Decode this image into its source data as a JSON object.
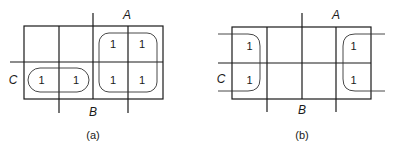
{
  "maps": [
    {
      "caption": "(a)",
      "labels": {
        "A": "A",
        "B": "B",
        "C": "C"
      },
      "cells": [
        [
          "",
          "",
          "1",
          "1"
        ],
        [
          "1",
          "1",
          "1",
          "1"
        ]
      ]
    },
    {
      "caption": "(b)",
      "labels": {
        "A": "A",
        "B": "B",
        "C": "C"
      },
      "cells": [
        [
          "1",
          "",
          "",
          "1"
        ],
        [
          "1",
          "",
          "",
          "1"
        ]
      ]
    }
  ]
}
